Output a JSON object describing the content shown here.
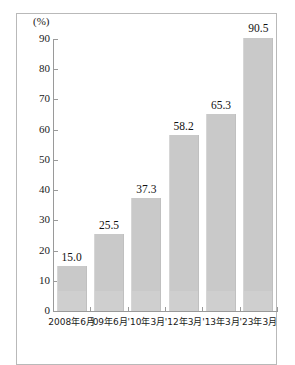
{
  "chart_data": {
    "type": "bar",
    "title": "",
    "subtitle": "",
    "unit_label": "(%)",
    "xlabel": "",
    "ylabel": "",
    "categories": [
      "2008年6月",
      "'09年6月",
      "'10年3月",
      "'12年3月",
      "'13年3月",
      "'23年3月"
    ],
    "values": [
      15.0,
      25.5,
      37.3,
      58.2,
      65.3,
      90.5
    ],
    "value_labels": [
      "15.0",
      "25.5",
      "37.3",
      "58.2",
      "65.3",
      "90.5"
    ],
    "ylim": [
      0,
      90
    ],
    "ytick_values": [
      0,
      10,
      20,
      30,
      40,
      50,
      60,
      70,
      80,
      90
    ],
    "ytick_labels": [
      "0",
      "10",
      "20",
      "30",
      "40",
      "50",
      "60",
      "70",
      "80",
      "90"
    ],
    "grid": false,
    "legend": null,
    "series": [
      {
        "name": "",
        "values": [
          15.0,
          25.5,
          37.3,
          58.2,
          65.3,
          90.5
        ],
        "color": "#c9c9c9"
      }
    ],
    "colors": {
      "bar_fill": "#c9c9c9",
      "axis": "#9a9a9a",
      "frame": "#b9b9b9",
      "text": "#1a1a1a",
      "background": "#ffffff"
    }
  }
}
